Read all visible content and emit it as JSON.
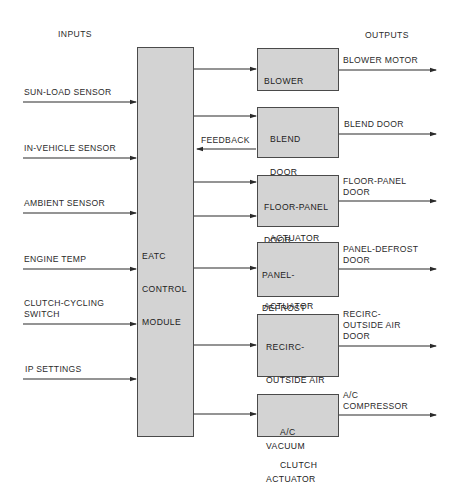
{
  "headings": {
    "inputs": "INPUTS",
    "outputs": "OUTPUTS"
  },
  "control_module": {
    "lines": [
      "EATC",
      "CONTROL",
      "MODULE"
    ]
  },
  "inputs": [
    {
      "lines": [
        "SUN-LOAD SENSOR"
      ]
    },
    {
      "lines": [
        "IN-VEHICLE SENSOR"
      ]
    },
    {
      "lines": [
        "AMBIENT SENSOR"
      ]
    },
    {
      "lines": [
        "ENGINE TEMP"
      ]
    },
    {
      "lines": [
        "CLUTCH-CYCLING",
        "SWITCH"
      ]
    },
    {
      "lines": [
        "IP SETTINGS"
      ]
    }
  ],
  "actuators": [
    {
      "lines": [
        "BLOWER",
        "SPEED",
        "CONTROLLER"
      ]
    },
    {
      "lines": [
        "BLEND",
        "DOOR",
        "ELECTRIC",
        "ACTUATOR"
      ]
    },
    {
      "lines": [
        "FLOOR-PANEL",
        "DOOR",
        "VACUUM",
        "ACTUATOR"
      ]
    },
    {
      "lines": [
        "PANEL-",
        "DEFROST",
        "DOOR VACUUM",
        "ACTUATOR"
      ]
    },
    {
      "lines": [
        "RECIRC-",
        "OUTSIDE AIR",
        "DOOR",
        "VACUUM",
        "ACTUATOR"
      ]
    },
    {
      "lines": [
        "A/C",
        "CLUTCH"
      ]
    }
  ],
  "outputs": [
    {
      "lines": [
        "BLOWER MOTOR"
      ]
    },
    {
      "lines": [
        "BLEND DOOR"
      ]
    },
    {
      "lines": [
        "FLOOR-PANEL",
        "DOOR"
      ]
    },
    {
      "lines": [
        "PANEL-DEFROST",
        "DOOR"
      ]
    },
    {
      "lines": [
        "RECIRC-",
        "OUTSIDE AIR",
        "DOOR"
      ]
    },
    {
      "lines": [
        "A/C",
        "COMPRESSOR"
      ]
    }
  ],
  "feedback_label": "FEEDBACK",
  "colors": {
    "box_fill": "#d3d3d3",
    "line": "#2a2a2a"
  }
}
